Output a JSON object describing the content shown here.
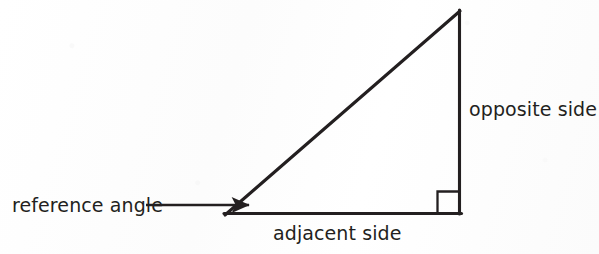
{
  "figure": {
    "kind": "right-triangle-trigonometry-diagram",
    "background_color": "#fdfdfd",
    "stroke_color": "#231f20",
    "text_color": "#231f20",
    "labels": {
      "reference_angle": "reference angle",
      "opposite_side": "opposite side",
      "adjacent_side": "adjacent side"
    },
    "geometry": {
      "left_vertex": [
        225,
        215
      ],
      "apex_vertex": [
        460,
        11
      ],
      "right_vertex": [
        461,
        214
      ],
      "right_angle_marker": {
        "x": 437,
        "y": 191,
        "size": 22
      },
      "leader_line": {
        "x_start": 146,
        "x_end": 252,
        "y": 205,
        "arrowhead_tip_x": 252
      }
    }
  }
}
